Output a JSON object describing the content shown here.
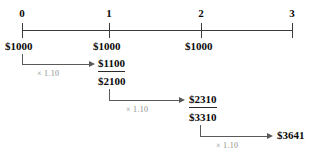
{
  "diagram": {
    "axis": {
      "line_color": "#3b3b3b",
      "periods": [
        {
          "label": "0",
          "x": 22
        },
        {
          "label": "1",
          "x": 109
        },
        {
          "label": "2",
          "x": 201
        },
        {
          "label": "3",
          "x": 292
        }
      ]
    },
    "cash_flows": [
      {
        "label": "$1000",
        "period": "0"
      },
      {
        "label": "$1000",
        "period": "1"
      },
      {
        "label": "$1000",
        "period": "2"
      }
    ],
    "growth_factor": "× 1.10",
    "steps": [
      {
        "factor": "× 1.10",
        "grown_value": "$1100",
        "running_total": "$2100"
      },
      {
        "factor": "× 1.10",
        "grown_value": "$2310",
        "running_total": "$3310"
      }
    ],
    "final": {
      "factor": "× 1.10",
      "value": "$3641"
    },
    "colors": {
      "axis": "#3b3b3b",
      "arrow": "#5a5a5a",
      "factor_text": "#8d8d8d",
      "value_text": "#0a0a0a",
      "background": "#ffffff"
    }
  }
}
